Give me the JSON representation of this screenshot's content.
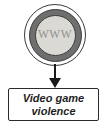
{
  "diagram": {
    "node": {
      "label": "WWW"
    },
    "box": {
      "line1": "Video game",
      "line2": "violence"
    },
    "colors": {
      "background": "#ffffff",
      "outline": "#3b3b3b",
      "ring": "#6f6f6f",
      "inner_fill": "#dad9d4",
      "www_text": "#90908d",
      "arrow": "#1a1a1a",
      "box_border": "#2b2b2b",
      "box_text": "#1f1f1f"
    }
  }
}
